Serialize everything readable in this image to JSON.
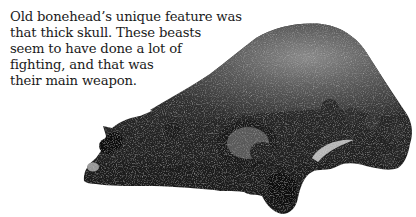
{
  "caption": {
    "lines": [
      "Old bonehead’s unique feature was",
      "that thick skull. These beasts",
      "seem to have done a lot of",
      "fighting, and that was",
      "their main weapon."
    ]
  },
  "illustration": {
    "subject": "fossil-dinosaur-skull-photo",
    "colors": {
      "background": "#ffffff",
      "skull_dark": "#1c1c1c",
      "skull_mid": "#4a4a4a",
      "skull_light": "#8a8a8a",
      "text": "#1a1a1a"
    }
  }
}
